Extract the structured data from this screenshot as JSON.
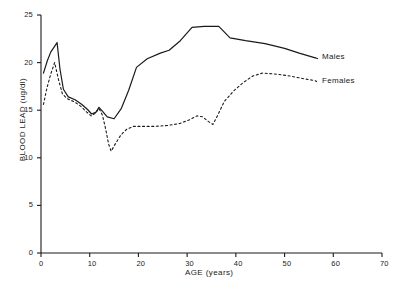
{
  "chart_data": {
    "type": "line",
    "title": "",
    "xlabel": "AGE (years)",
    "ylabel": "BLOOD LEAD (ug/dl)",
    "xlim": [
      0,
      70
    ],
    "ylim": [
      0,
      25
    ],
    "xticks": [
      0,
      10,
      20,
      30,
      40,
      50,
      60,
      70
    ],
    "yticks": [
      0,
      5,
      10,
      15,
      20,
      25
    ],
    "grid": false,
    "legend_position": "inline-right",
    "series": [
      {
        "name": "Males",
        "style": "solid",
        "color": "#1a1a1a",
        "points": [
          [
            0.5,
            18.9
          ],
          [
            1.3,
            20.2
          ],
          [
            2.0,
            21.1
          ],
          [
            3.3,
            22.1
          ],
          [
            3.9,
            19.3
          ],
          [
            4.6,
            17.2
          ],
          [
            5.6,
            16.4
          ],
          [
            7.0,
            16.1
          ],
          [
            8.4,
            15.6
          ],
          [
            9.5,
            15.1
          ],
          [
            10.4,
            14.6
          ],
          [
            11.3,
            14.8
          ],
          [
            11.9,
            15.3
          ],
          [
            12.6,
            14.9
          ],
          [
            13.6,
            14.3
          ],
          [
            15.0,
            14.1
          ],
          [
            16.5,
            15.2
          ],
          [
            18.0,
            17.1
          ],
          [
            19.6,
            19.5
          ],
          [
            21.8,
            20.4
          ],
          [
            24.5,
            21.0
          ],
          [
            26.3,
            21.3
          ],
          [
            28.6,
            22.3
          ],
          [
            31.0,
            23.7
          ],
          [
            33.5,
            23.8
          ],
          [
            36.5,
            23.8
          ],
          [
            38.8,
            22.6
          ],
          [
            42.0,
            22.3
          ],
          [
            46.0,
            22.0
          ],
          [
            50.0,
            21.5
          ],
          [
            53.0,
            21.0
          ],
          [
            56.3,
            20.5
          ]
        ]
      },
      {
        "name": "Females",
        "style": "dotted",
        "color": "#1a1a1a",
        "points": [
          [
            0.5,
            15.6
          ],
          [
            1.2,
            17.3
          ],
          [
            2.0,
            18.8
          ],
          [
            2.8,
            20.0
          ],
          [
            3.6,
            18.2
          ],
          [
            4.4,
            16.7
          ],
          [
            5.4,
            16.2
          ],
          [
            6.8,
            15.9
          ],
          [
            8.2,
            15.4
          ],
          [
            9.4,
            14.8
          ],
          [
            10.3,
            14.4
          ],
          [
            11.2,
            14.7
          ],
          [
            11.9,
            15.2
          ],
          [
            12.6,
            14.5
          ],
          [
            13.2,
            13.2
          ],
          [
            13.9,
            11.4
          ],
          [
            14.4,
            10.7
          ],
          [
            15.3,
            11.5
          ],
          [
            16.4,
            12.4
          ],
          [
            17.6,
            13.0
          ],
          [
            19.0,
            13.3
          ],
          [
            21.0,
            13.3
          ],
          [
            23.5,
            13.3
          ],
          [
            26.0,
            13.4
          ],
          [
            28.5,
            13.6
          ],
          [
            30.5,
            14.0
          ],
          [
            32.0,
            14.4
          ],
          [
            33.2,
            14.3
          ],
          [
            34.4,
            13.8
          ],
          [
            35.3,
            13.5
          ],
          [
            36.4,
            14.6
          ],
          [
            37.6,
            15.9
          ],
          [
            39.5,
            17.0
          ],
          [
            41.5,
            17.9
          ],
          [
            43.5,
            18.6
          ],
          [
            45.5,
            18.9
          ],
          [
            48.0,
            18.8
          ],
          [
            51.0,
            18.6
          ],
          [
            54.0,
            18.3
          ],
          [
            56.3,
            18.1
          ]
        ]
      }
    ]
  },
  "axis": {
    "y_title": "BLOOD LEAD (ug/dl)",
    "x_title": "AGE (years)",
    "y_tick_labels": [
      "0",
      "5",
      "10",
      "15",
      "20",
      "25"
    ],
    "x_tick_labels": [
      "0",
      "10",
      "20",
      "30",
      "40",
      "50",
      "60",
      "70"
    ]
  },
  "legend": {
    "males_label": "Males",
    "females_label": "Females"
  }
}
